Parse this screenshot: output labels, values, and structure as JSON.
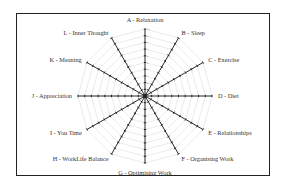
{
  "chart_data": {
    "type": "radar",
    "title": "",
    "categories": [
      "A - Relaxation",
      "B - Sleep",
      "C - Exercise",
      "D - Diet",
      "E - Relationships",
      "F - Organising Work",
      "G - Optimising Work",
      "H - WorkLife Balance",
      "I - You Time",
      "J - Appreciation",
      "K - Meaning",
      "L - Inner Thought"
    ],
    "series": [],
    "radial_axis": {
      "min": 0,
      "max": 10,
      "ticks": [
        1,
        2,
        3,
        4,
        5,
        6,
        7,
        8,
        9,
        10
      ]
    },
    "grid": true,
    "grid_shape": "polygon",
    "legend": "none"
  },
  "colors": {
    "axis": "#2a2a2a",
    "grid": "#d6d6d6",
    "frame": "#222222",
    "label": "#333333"
  }
}
